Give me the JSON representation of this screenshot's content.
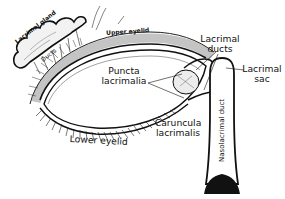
{
  "diagram": {
    "colors": {
      "background": "#ffffff",
      "ink": "#111111",
      "shade": "#555555"
    },
    "labels": {
      "lacrimal_gland": "Lacrimal gland",
      "ducts_small": "Ducts",
      "upper_eyelid": "Upper eyelid",
      "lacrimal_ducts_line1": "Lacrimal",
      "lacrimal_ducts_line2": "ducts",
      "puncta_line1": "Puncta",
      "puncta_line2": "lacrimalia",
      "lacrimal_sac_line1": "Lacrimal",
      "lacrimal_sac_line2": "sac",
      "caruncula_line1": "Caruncula",
      "caruncula_line2": "lacrimalis",
      "lower_eyelid": "Lower eyelid",
      "nasolacrimal_duct": "Nasolacrimal duct"
    }
  }
}
